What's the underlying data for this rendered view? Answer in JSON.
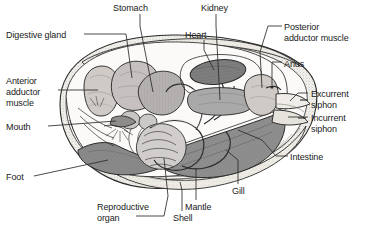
{
  "figure": {
    "view": "left lateral dissection, shell valve removed",
    "background_color": "#ffffff",
    "text_color": "#1a1a1a",
    "leader_line_color": "#2b2b2b"
  },
  "labels": [
    {
      "id": "digestive-gland",
      "text": "Digestive gland",
      "x": 6,
      "y": 30,
      "align": "left"
    },
    {
      "id": "stomach",
      "text": "Stomach",
      "x": 113,
      "y": 3,
      "align": "left"
    },
    {
      "id": "kidney",
      "text": "Kidney",
      "x": 201,
      "y": 3,
      "align": "left"
    },
    {
      "id": "heart",
      "text": "Heart",
      "x": 185,
      "y": 30,
      "align": "left"
    },
    {
      "id": "posterior-adductor-line1",
      "text": "Posterior",
      "x": 284,
      "y": 22,
      "align": "left"
    },
    {
      "id": "posterior-adductor-line2",
      "text": "adductor muscle",
      "x": 284,
      "y": 33,
      "align": "left"
    },
    {
      "id": "anus",
      "text": "Anus",
      "x": 284,
      "y": 59,
      "align": "left"
    },
    {
      "id": "anterior-adductor-line1",
      "text": "Anterior",
      "x": 6,
      "y": 76,
      "align": "left"
    },
    {
      "id": "anterior-adductor-line2",
      "text": "adductor",
      "x": 6,
      "y": 87,
      "align": "left"
    },
    {
      "id": "anterior-adductor-line3",
      "text": "muscle",
      "x": 6,
      "y": 98,
      "align": "left"
    },
    {
      "id": "excurrent-siphon-line1",
      "text": "Excurrent",
      "x": 311,
      "y": 89,
      "align": "left"
    },
    {
      "id": "excurrent-siphon-line2",
      "text": "siphon",
      "x": 311,
      "y": 100,
      "align": "left"
    },
    {
      "id": "incurrent-siphon-line1",
      "text": "Incurrent",
      "x": 311,
      "y": 113,
      "align": "left"
    },
    {
      "id": "incurrent-siphon-line2",
      "text": "siphon",
      "x": 311,
      "y": 124,
      "align": "left"
    },
    {
      "id": "mouth",
      "text": "Mouth",
      "x": 6,
      "y": 122,
      "align": "left"
    },
    {
      "id": "intestine",
      "text": "Intestine",
      "x": 290,
      "y": 152,
      "align": "left"
    },
    {
      "id": "foot",
      "text": "Foot",
      "x": 6,
      "y": 172,
      "align": "left"
    },
    {
      "id": "gill",
      "text": "Gill",
      "x": 232,
      "y": 186,
      "align": "left"
    },
    {
      "id": "mantle",
      "text": "Mantle",
      "x": 185,
      "y": 202,
      "align": "left"
    },
    {
      "id": "reproductive-organ-line1",
      "text": "Reproductive",
      "x": 97,
      "y": 202,
      "align": "left"
    },
    {
      "id": "reproductive-organ-line2",
      "text": "organ",
      "x": 97,
      "y": 213,
      "align": "left"
    },
    {
      "id": "shell",
      "text": "Shell",
      "x": 173,
      "y": 213,
      "align": "left"
    }
  ],
  "colors": {
    "outline": "#2b2b2b",
    "shell_fill": "#f2f0ec",
    "shell_stipple": "#b8b4ac",
    "mantle_fill": "#efece6",
    "foot_fill": "#8a8a8a",
    "gill_fill": "#8f8f8f",
    "heart_fill": "#7e7e7e",
    "kidney_fill": "#a9a9a9",
    "stomach_fill": "#b5b1b1",
    "digestive_fill": "#c6c0c0",
    "adductor_fill": "#cfcac6",
    "organ_light": "#dedad6",
    "body_fill": "#fbfaf8"
  }
}
